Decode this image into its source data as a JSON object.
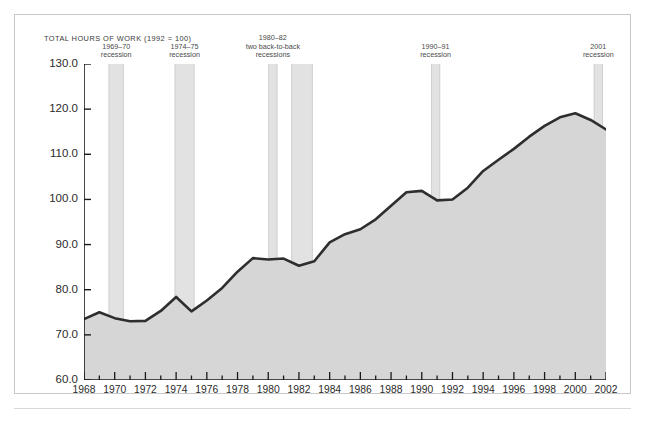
{
  "chart_data": {
    "type": "area",
    "title": "TOTAL HOURS OF WORK (1992 = 100)",
    "xlabel": "",
    "ylabel": "",
    "xlim": [
      1968,
      2002
    ],
    "ylim": [
      60.0,
      130.0
    ],
    "grid": false,
    "legend": "none",
    "y_ticks": [
      "60.0",
      "70.0",
      "80.0",
      "90.0",
      "100.0",
      "110.0",
      "120.0",
      "130.0"
    ],
    "y_tick_values": [
      60.0,
      70.0,
      80.0,
      90.0,
      100.0,
      110.0,
      120.0,
      130.0
    ],
    "x_ticks": [
      "1968",
      "1970",
      "1972",
      "1974",
      "1976",
      "1978",
      "1980",
      "1982",
      "1984",
      "1986",
      "1988",
      "1990",
      "1992",
      "1994",
      "1996",
      "1998",
      "2000",
      "2002"
    ],
    "x_tick_values": [
      1968,
      1970,
      1972,
      1974,
      1976,
      1978,
      1980,
      1982,
      1984,
      1986,
      1988,
      1990,
      1992,
      1994,
      1996,
      1998,
      2000,
      2002
    ],
    "x": [
      1968,
      1969,
      1970,
      1971,
      1972,
      1973,
      1974,
      1975,
      1976,
      1977,
      1978,
      1979,
      1980,
      1981,
      1982,
      1983,
      1984,
      1985,
      1986,
      1987,
      1988,
      1989,
      1990,
      1991,
      1992,
      1993,
      1994,
      1995,
      1996,
      1997,
      1998,
      1999,
      2000,
      2001,
      2002
    ],
    "values": [
      73.5,
      75.0,
      73.7,
      73.0,
      73.1,
      75.3,
      78.4,
      75.2,
      77.6,
      80.4,
      84.0,
      87.0,
      86.7,
      86.9,
      85.3,
      86.3,
      90.5,
      92.3,
      93.4,
      95.6,
      98.6,
      101.6,
      101.9,
      99.8,
      100.0,
      102.6,
      106.3,
      108.8,
      111.2,
      113.9,
      116.3,
      118.2,
      119.1,
      117.6,
      115.5
    ],
    "series": [
      {
        "name": "Total hours of work",
        "values": [
          73.5,
          75.0,
          73.7,
          73.0,
          73.1,
          75.3,
          78.4,
          75.2,
          77.6,
          80.4,
          84.0,
          87.0,
          86.7,
          86.9,
          85.3,
          86.3,
          90.5,
          92.3,
          93.4,
          95.6,
          98.6,
          101.6,
          101.9,
          99.8,
          100.0,
          102.6,
          106.3,
          108.8,
          111.2,
          113.9,
          116.3,
          118.2,
          119.1,
          117.6,
          115.5
        ]
      }
    ],
    "recession_bands": [
      {
        "label_line1": "1969–70",
        "label_line2": "recession",
        "start": 1969.6,
        "end": 1970.6
      },
      {
        "label_line1": "1974–75",
        "label_line2": "recession",
        "start": 1973.9,
        "end": 1975.2
      },
      {
        "label_line1": "1980–82",
        "label_line2": "two back-to-back",
        "label_line3": "recessions",
        "start": 1980.0,
        "end": 1980.6
      },
      {
        "label_line1": "",
        "label_line2": "",
        "start": 1981.5,
        "end": 1982.9
      },
      {
        "label_line1": "1990–91",
        "label_line2": "recession",
        "start": 1990.6,
        "end": 1991.2
      },
      {
        "label_line1": "2001",
        "label_line2": "recession",
        "start": 2001.2,
        "end": 2001.8
      }
    ],
    "colors": {
      "line": "#2e2e2e",
      "area_fill": "#d6d6d6",
      "recession_band": "#e2e2e2",
      "axis": "#1a1a1a",
      "frame": "#c9c9c9",
      "background": "#ffffff",
      "text": "#2b2b2b"
    }
  }
}
